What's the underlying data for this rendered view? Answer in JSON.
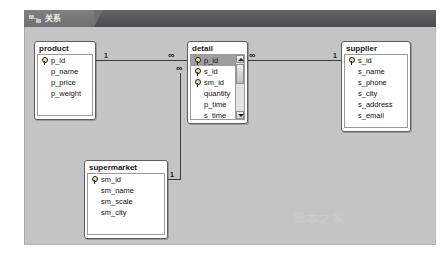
{
  "window": {
    "tab_label": "关系",
    "tab_icon": "relationships-icon"
  },
  "canvas": {
    "watermark": "脚本之家"
  },
  "tables": [
    {
      "name": "product",
      "fields": [
        {
          "name": "p_id",
          "key": true,
          "selected": false
        },
        {
          "name": "p_name",
          "key": false,
          "selected": false
        },
        {
          "name": "p_price",
          "key": false,
          "selected": false
        },
        {
          "name": "p_weight",
          "key": false,
          "selected": false
        }
      ],
      "scrollbar": false
    },
    {
      "name": "detail",
      "fields": [
        {
          "name": "p_id",
          "key": true,
          "selected": true
        },
        {
          "name": "s_id",
          "key": true,
          "selected": false
        },
        {
          "name": "sm_id",
          "key": true,
          "selected": false
        },
        {
          "name": "quantity",
          "key": false,
          "selected": false
        },
        {
          "name": "p_time",
          "key": false,
          "selected": false
        },
        {
          "name": "s_time",
          "key": false,
          "selected": false
        }
      ],
      "scrollbar": true
    },
    {
      "name": "supplier",
      "fields": [
        {
          "name": "s_id",
          "key": true,
          "selected": false
        },
        {
          "name": "s_name",
          "key": false,
          "selected": false
        },
        {
          "name": "s_phone",
          "key": false,
          "selected": false
        },
        {
          "name": "s_city",
          "key": false,
          "selected": false
        },
        {
          "name": "s_address",
          "key": false,
          "selected": false
        },
        {
          "name": "s_email",
          "key": false,
          "selected": false
        }
      ],
      "scrollbar": false
    },
    {
      "name": "supermarket",
      "fields": [
        {
          "name": "sm_id",
          "key": true,
          "selected": false
        },
        {
          "name": "sm_name",
          "key": false,
          "selected": false
        },
        {
          "name": "sm_scale",
          "key": false,
          "selected": false
        },
        {
          "name": "sm_city",
          "key": false,
          "selected": false
        }
      ],
      "scrollbar": false
    }
  ],
  "relationships": [
    {
      "id": "product-detail",
      "from_table": "product",
      "to_table": "detail",
      "from_cardinality": "1",
      "to_cardinality": "∞"
    },
    {
      "id": "detail-supplier",
      "from_table": "detail",
      "to_table": "supplier",
      "from_cardinality": "∞",
      "to_cardinality": "1"
    },
    {
      "id": "detail-supermarket",
      "from_table": "detail",
      "to_table": "supermarket",
      "from_cardinality": "∞",
      "to_cardinality": "1"
    }
  ]
}
